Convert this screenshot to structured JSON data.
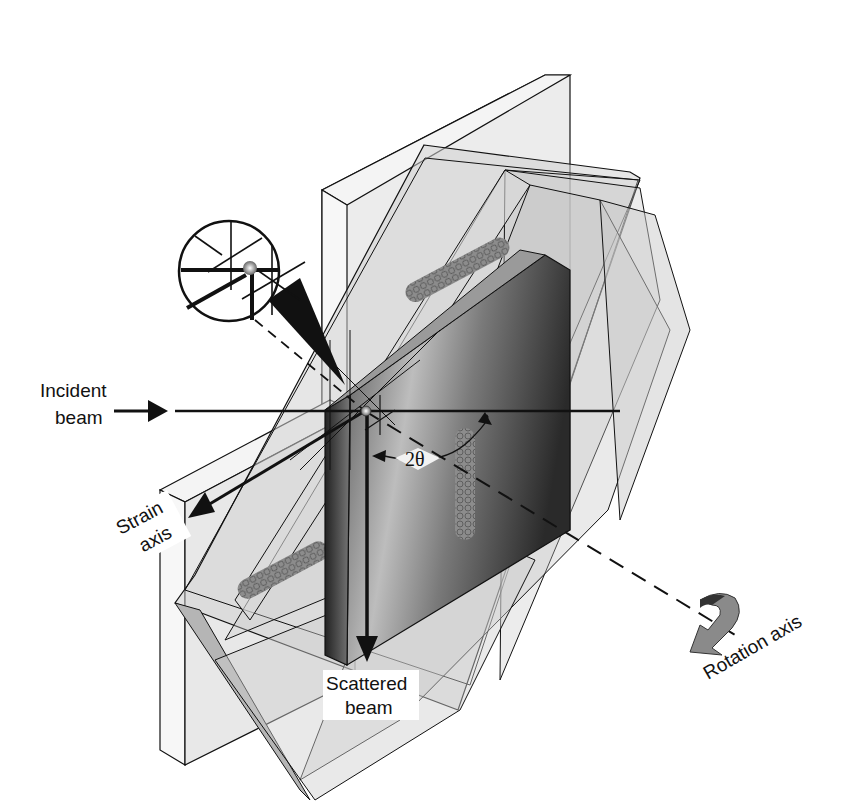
{
  "diagram": {
    "type": "neutron strain scanning geometry",
    "labels": {
      "incident_beam_line1": "Incident",
      "incident_beam_line2": "beam",
      "strain_axis_line1": "Strain",
      "strain_axis_line2": "axis",
      "scattered_beam_line1": "Scattered",
      "scattered_beam_line2": "beam",
      "rotation_axis": "Rotation axis",
      "angle": "2θ"
    },
    "elements": [
      "outer-plate",
      "rotated-plates",
      "dark-sample-plate",
      "weld-beads",
      "magnifier-inset",
      "gauge-volume-point"
    ],
    "colors": {
      "line": "#111111",
      "plate_light": "#e6e6e6",
      "plate_mid": "#c9c9c9",
      "sample_dark": "#3a3a3a",
      "background": "#ffffff"
    }
  }
}
